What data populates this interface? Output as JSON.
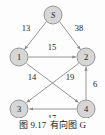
{
  "figure": {
    "caption_number": "图 9.17",
    "caption_title": "有向图 G",
    "background_color": "#fdfdfd",
    "node_fill_color": "#d6d6d6",
    "node_stroke_color": "#8c8c8c",
    "edge_color": "#8a8a8a",
    "label_color": "#1c1c1c"
  },
  "graph": {
    "type": "directed-weighted-graph",
    "nodes": [
      {
        "id": "S",
        "label": "S",
        "italic": true,
        "x": 53,
        "y": 15,
        "r": 9
      },
      {
        "id": "1",
        "label": "1",
        "italic": false,
        "x": 19,
        "y": 57,
        "r": 9
      },
      {
        "id": "2",
        "label": "2",
        "italic": false,
        "x": 86,
        "y": 57,
        "r": 9
      },
      {
        "id": "3",
        "label": "3",
        "italic": false,
        "x": 19,
        "y": 109,
        "r": 9
      },
      {
        "id": "4",
        "label": "4",
        "italic": false,
        "x": 86,
        "y": 109,
        "r": 9
      }
    ],
    "edges": [
      {
        "from": "S",
        "to": "1",
        "weight": "13",
        "label_x": 26,
        "label_y": 31
      },
      {
        "from": "S",
        "to": "2",
        "weight": "38",
        "label_x": 79,
        "label_y": 31
      },
      {
        "from": "1",
        "to": "2",
        "weight": "15",
        "label_x": 52,
        "label_y": 50
      },
      {
        "from": "1",
        "to": "4",
        "weight": "14",
        "label_x": 32,
        "label_y": 80
      },
      {
        "from": "2",
        "to": "3",
        "weight": "19",
        "label_x": 70,
        "label_y": 80
      },
      {
        "from": "4",
        "to": "2",
        "weight": "6",
        "label_x": 94,
        "label_y": 86
      },
      {
        "from": "4",
        "to": "3",
        "weight": "17",
        "label_x": 52,
        "label_y": 121
      }
    ]
  }
}
